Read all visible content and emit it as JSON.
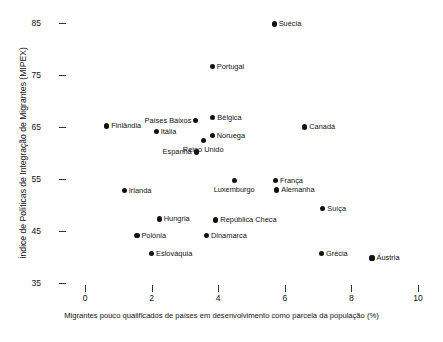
{
  "chart_data": {
    "type": "scatter",
    "title": "",
    "xlabel": "Migrantes pouco qualificados de países em desenvolvimento como parcela da população (%)",
    "ylabel": "Índice de Políticas de Integração de Migrantes (MIPEX)",
    "xlim": [
      0,
      10
    ],
    "ylim": [
      31,
      88
    ],
    "xticks": [
      0,
      2,
      4,
      6,
      8,
      10
    ],
    "xtick_labels": [
      "0",
      "2",
      "4",
      "6",
      "8",
      "10"
    ],
    "yticks": [
      35,
      45,
      55,
      65,
      75,
      85
    ],
    "ytick_labels": [
      "35",
      "45",
      "55",
      "65",
      "75",
      "85"
    ],
    "grid": false,
    "legend": false,
    "marker_color": "#111111",
    "points": [
      {
        "label": "Suécia",
        "x": 5.68,
        "y": 84.8,
        "label_pos": "right"
      },
      {
        "label": "Portugal",
        "x": 3.82,
        "y": 76.7,
        "label_pos": "right"
      },
      {
        "label": "Bélgica",
        "x": 3.84,
        "y": 66.9,
        "label_pos": "right"
      },
      {
        "label": "Países Baixos",
        "x": 3.33,
        "y": 66.2,
        "label_pos": "left"
      },
      {
        "label": "Canadá",
        "x": 6.6,
        "y": 65.0,
        "label_pos": "right"
      },
      {
        "label": "Finlândia",
        "x": 0.65,
        "y": 65.2,
        "label_pos": "right"
      },
      {
        "label": "Itália",
        "x": 2.14,
        "y": 64.2,
        "label_pos": "right"
      },
      {
        "label": "Noruega",
        "x": 3.82,
        "y": 63.4,
        "label_pos": "right"
      },
      {
        "label": "Reino Unido",
        "x": 3.55,
        "y": 62.4,
        "label_pos": "below"
      },
      {
        "label": "Espanha",
        "x": 3.34,
        "y": 60.2,
        "label_pos": "left"
      },
      {
        "label": "França",
        "x": 5.72,
        "y": 54.7,
        "label_pos": "right"
      },
      {
        "label": "Luxemburgo",
        "x": 4.48,
        "y": 54.7,
        "label_pos": "below"
      },
      {
        "label": "Alemanha",
        "x": 5.76,
        "y": 52.9,
        "label_pos": "right"
      },
      {
        "label": "Irlanda",
        "x": 1.18,
        "y": 52.8,
        "label_pos": "right"
      },
      {
        "label": "Suíça",
        "x": 7.14,
        "y": 49.3,
        "label_pos": "right"
      },
      {
        "label": "Hungria",
        "x": 2.23,
        "y": 47.3,
        "label_pos": "right"
      },
      {
        "label": "República Checa",
        "x": 3.93,
        "y": 47.1,
        "label_pos": "right"
      },
      {
        "label": "Polónia",
        "x": 1.56,
        "y": 44.2,
        "label_pos": "right"
      },
      {
        "label": "Dinamarca",
        "x": 3.65,
        "y": 44.2,
        "label_pos": "right"
      },
      {
        "label": "Eslováquia",
        "x": 2.0,
        "y": 40.7,
        "label_pos": "right"
      },
      {
        "label": "Grécia",
        "x": 7.1,
        "y": 40.7,
        "label_pos": "right"
      },
      {
        "label": "Áustria",
        "x": 8.62,
        "y": 39.8,
        "label_pos": "right"
      }
    ]
  }
}
